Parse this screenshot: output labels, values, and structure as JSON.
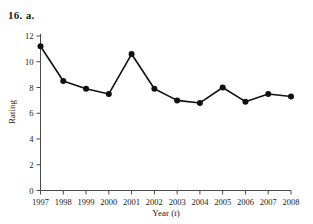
{
  "figure": {
    "exercise_label": "16. a.",
    "ghost_header_text": ""
  },
  "chart_data": {
    "type": "line",
    "title": "",
    "xlabel": "Year (t)",
    "ylabel": "Rating",
    "categories": [
      "1997",
      "1998",
      "1999",
      "2000",
      "2001",
      "2002",
      "2003",
      "2004",
      "2005",
      "2006",
      "2007",
      "2008"
    ],
    "values": [
      11.2,
      8.5,
      7.9,
      7.5,
      10.6,
      7.9,
      7.0,
      6.8,
      8.0,
      6.9,
      7.5,
      7.3
    ],
    "ylim": [
      0,
      12
    ],
    "y_ticks": [
      "0",
      "2",
      "4",
      "6",
      "8",
      "10",
      "12"
    ],
    "x_ticks": [
      "1997",
      "1998",
      "1999",
      "2000",
      "2001",
      "2002",
      "2003",
      "2004",
      "2005",
      "2006",
      "2007",
      "2008"
    ],
    "grid": false,
    "legend": false,
    "marker": "filled-circle",
    "line_color": "#111111",
    "axis_color": "#4a4a4a"
  }
}
